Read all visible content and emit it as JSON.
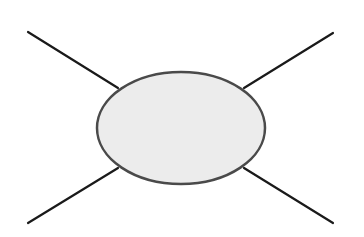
{
  "diagram": {
    "width": 364,
    "height": 237,
    "background": "#ffffff",
    "central_node": {
      "shape": "ellipse",
      "cx": 181,
      "cy": 128,
      "rx": 84,
      "ry": 56,
      "fill": "#ececec",
      "stroke": "#4a4a4a",
      "stroke_width": 2.5,
      "label": ""
    },
    "connectors": [
      {
        "id": "top-left",
        "x1": 28,
        "y1": 32,
        "x2": 118,
        "y2": 88,
        "color": "#1a1a1a",
        "width": 2.2
      },
      {
        "id": "top-right",
        "x1": 333,
        "y1": 33,
        "x2": 244,
        "y2": 88,
        "color": "#1a1a1a",
        "width": 2.2
      },
      {
        "id": "bottom-left",
        "x1": 28,
        "y1": 223,
        "x2": 118,
        "y2": 168,
        "color": "#1a1a1a",
        "width": 2.2
      },
      {
        "id": "bottom-right",
        "x1": 333,
        "y1": 223,
        "x2": 244,
        "y2": 168,
        "color": "#1a1a1a",
        "width": 2.2
      }
    ]
  }
}
